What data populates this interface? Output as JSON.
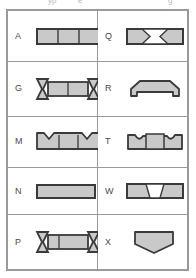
{
  "page": {
    "background_color": "#ffffff"
  },
  "top_clipped_text": {
    "fragment_1": "yp",
    "fragment_2": "e",
    "fragment_3": "g"
  },
  "style": {
    "shape_fill": "#c9c9c9",
    "shape_stroke": "#3a3a3a",
    "table_border": "#9a9a9a",
    "label_color": "#4a4a4a"
  },
  "table": {
    "columns": 2,
    "rows": 5,
    "cells": [
      {
        "code": "A",
        "shape": "segmented-rectangle",
        "description": "Rectangle divided into three vertical segments"
      },
      {
        "code": "Q",
        "shape": "rectangle-with-inner-hourglass",
        "description": "Rectangle with an hourglass/bowtie inscribed in the centre"
      },
      {
        "code": "G",
        "shape": "bowtie-ends-segmented-bar",
        "description": "Bar with bowtie notches at both ends and two centre segments"
      },
      {
        "code": "R",
        "shape": "notched-trapezoid",
        "description": "Flat trapezoid with stepped notches at the lower corners"
      },
      {
        "code": "M",
        "shape": "rectangle-with-top-v-notches",
        "description": "Three segment rectangle with V notches cut into the top ends"
      },
      {
        "code": "T",
        "shape": "raised-centre-with-notches",
        "description": "Rectangle with raised centre block and curved notches either side"
      },
      {
        "code": "N",
        "shape": "plain-rectangle",
        "description": "Plain rectangle"
      },
      {
        "code": "W",
        "shape": "rectangle-with-centre-wedge",
        "description": "Rectangle with a trapezoidal wedge in the centre"
      },
      {
        "code": "P",
        "shape": "bowtie-ends-segmented-bar",
        "description": "Bar with bowtie notches at both ends and segmented centre"
      },
      {
        "code": "X",
        "shape": "downward-pentagon",
        "description": "Pentagon shield pointing downward"
      }
    ]
  }
}
